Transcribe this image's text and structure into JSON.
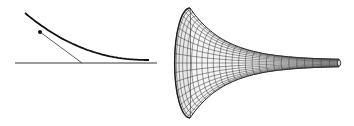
{
  "figure": {
    "background": "#ffffff",
    "line_color": "#1a1a1a",
    "left_panel": {
      "label": "tractrix",
      "curve": {
        "start": [
          25,
          13
        ],
        "end": [
          149,
          60
        ]
      },
      "point": [
        40,
        32
      ],
      "tangent_end": [
        82,
        63
      ],
      "axis": {
        "y": 63,
        "x_start": 15,
        "x_end": 157
      }
    },
    "right_panel": {
      "label": "pseudosphere",
      "rim_center": [
        190,
        63
      ],
      "rim_radius": 55,
      "tip_x": 339,
      "tip_radius": 3,
      "meridians": 36,
      "parallels": 26
    }
  }
}
